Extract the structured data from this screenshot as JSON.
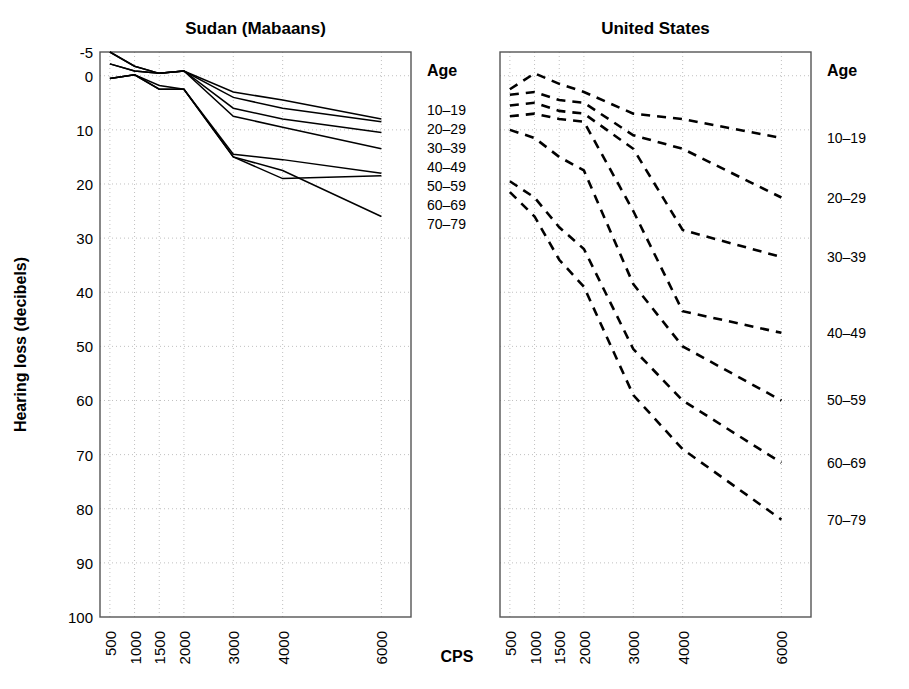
{
  "figure": {
    "xlabel": "CPS",
    "ylabel": "Hearing loss (decibels)",
    "legend_title_left": "Age",
    "legend_title_right": "Age"
  },
  "chart_data": {
    "type": "line",
    "title": "",
    "xlabel": "CPS",
    "ylabel": "Hearing loss (decibels)",
    "x": [
      500,
      1000,
      1500,
      2000,
      3000,
      4000,
      6000
    ],
    "xtick_labels": [
      "500",
      "1000",
      "1500",
      "2000",
      "3000",
      "4000",
      "6000"
    ],
    "ytick_labels": [
      "-5",
      "0",
      "10",
      "20",
      "30",
      "40",
      "50",
      "60",
      "70",
      "80",
      "90",
      "100"
    ],
    "ytick_values": [
      -5,
      0,
      10,
      20,
      30,
      40,
      50,
      60,
      70,
      80,
      90,
      100
    ],
    "ylim": [
      -5,
      100
    ],
    "y_inverted": true,
    "grid": true,
    "legend_position": "right-of-panel",
    "panels": [
      {
        "name": "sudan",
        "title": "Sudan (Mabaans)",
        "linestyle": "solid",
        "legend_title": "Age",
        "legend_labels": [
          "10–19",
          "20–29",
          "30–39",
          "40–49",
          "50–59",
          "60–69",
          "70–79"
        ],
        "series": [
          {
            "name": "10–19",
            "values": [
              -5.0,
              -2.0,
              -0.5,
              -1.0,
              3.0,
              4.5,
              8.0
            ]
          },
          {
            "name": "20–29",
            "values": [
              -2.5,
              -1.0,
              -0.5,
              -1.0,
              4.0,
              6.0,
              8.5
            ]
          },
          {
            "name": "30–39",
            "values": [
              -5.0,
              -2.0,
              -0.5,
              -1.0,
              6.0,
              8.0,
              10.5
            ]
          },
          {
            "name": "40–49",
            "values": [
              -2.5,
              -1.0,
              -0.5,
              -1.0,
              7.5,
              9.5,
              13.5
            ]
          },
          {
            "name": "50–59",
            "values": [
              0.5,
              -0.2,
              1.8,
              2.5,
              14.5,
              15.5,
              18.0
            ]
          },
          {
            "name": "60–69",
            "values": [
              0.5,
              -0.2,
              2.5,
              2.5,
              15.0,
              19.0,
              18.5
            ]
          },
          {
            "name": "70–79",
            "values": [
              0.5,
              -0.2,
              2.5,
              2.5,
              15.0,
              17.5,
              26.0
            ]
          }
        ]
      },
      {
        "name": "united-states",
        "title": "United States",
        "linestyle": "dashed",
        "legend_title": "Age",
        "legend_labels": [
          "10–19",
          "20–29",
          "30–39",
          "40–49",
          "50–59",
          "60–69",
          "70–79"
        ],
        "series": [
          {
            "name": "10–19",
            "values": [
              2.5,
              -0.5,
              1.5,
              3.0,
              7.0,
              8.0,
              11.5
            ]
          },
          {
            "name": "20–29",
            "values": [
              3.5,
              3.0,
              4.5,
              5.0,
              11.0,
              13.5,
              22.5
            ]
          },
          {
            "name": "30–39",
            "values": [
              5.5,
              5.0,
              6.5,
              7.0,
              13.5,
              28.5,
              33.5
            ]
          },
          {
            "name": "40–49",
            "values": [
              7.5,
              7.0,
              8.0,
              8.5,
              25.0,
              43.5,
              47.5
            ]
          },
          {
            "name": "50–59",
            "values": [
              10.0,
              11.5,
              15.0,
              17.5,
              38.5,
              50.0,
              60.0
            ]
          },
          {
            "name": "60–69",
            "values": [
              19.5,
              22.5,
              28.0,
              32.0,
              50.5,
              60.0,
              71.5
            ]
          },
          {
            "name": "70–79",
            "values": [
              21.5,
              26.0,
              34.0,
              39.0,
              59.0,
              69.0,
              82.0
            ]
          }
        ]
      }
    ]
  }
}
